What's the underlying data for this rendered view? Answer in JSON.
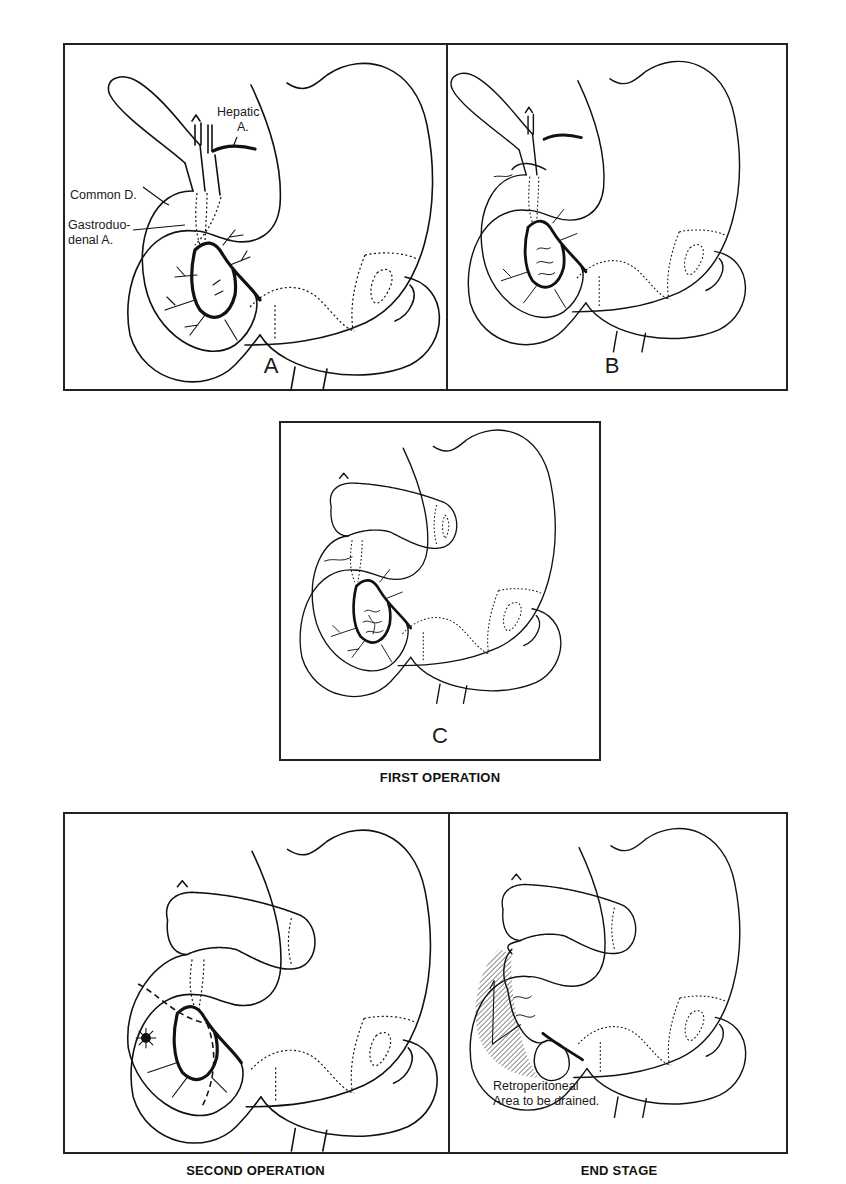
{
  "figure": {
    "panels": [
      {
        "id": "A",
        "letter": "A",
        "labels": {
          "hepatic_line1": "Hepatic",
          "hepatic_line2": "A.",
          "common_duct": "Common D.",
          "gastroduodenal_line1": "Gastroduo-",
          "gastroduodenal_line2": "denal A."
        }
      },
      {
        "id": "B",
        "letter": "B"
      },
      {
        "id": "C",
        "letter": "C"
      },
      {
        "id": "D",
        "letter": ""
      },
      {
        "id": "E",
        "letter": "",
        "labels": {
          "retroperitoneal_line1": "Retroperitoneal",
          "retroperitoneal_line2": "Area to be drained."
        }
      }
    ],
    "captions": {
      "first_operation": "FIRST OPERATION",
      "second_operation": "SECOND OPERATION",
      "end_stage": "END STAGE"
    }
  },
  "colors": {
    "line": "#111111",
    "frame": "#222222",
    "background": "#ffffff"
  }
}
